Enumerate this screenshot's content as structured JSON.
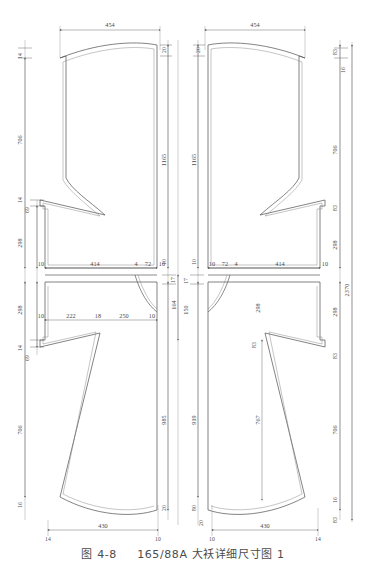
{
  "figure": {
    "caption_label": "图 4-8",
    "caption_title": "165/88A 大袄详细尺寸图 1",
    "caption_full": "图 4-8　165/88A 大袄详细尺寸图 1",
    "line_color": "#555555",
    "dim_color": "#4a4a4a",
    "background": "#ffffff"
  },
  "left_piece": {
    "name": "front-panel-left",
    "top_width": "454",
    "bottom_width": "430",
    "dims_top": [
      "20",
      "20"
    ],
    "dims_left_chain": [
      "14",
      "706",
      "14",
      "69",
      "298",
      "298",
      "14",
      "69",
      "706",
      "16"
    ],
    "dims_right_chain": [
      "1165",
      "10",
      "17",
      "164",
      "985",
      "20"
    ],
    "dims_waist_row": [
      "10",
      "414",
      "4",
      "72",
      "10"
    ],
    "dims_hip_row": [
      "10",
      "222",
      "18",
      "250",
      "10"
    ],
    "dims_bottom_row": [
      "14",
      "430",
      "10"
    ]
  },
  "right_piece": {
    "name": "front-panel-right",
    "top_width": "454",
    "bottom_width": "430",
    "dims_top": [
      "20",
      "20"
    ],
    "dims_left_chain": [
      "1165",
      "10",
      "17",
      "150",
      "298",
      "919",
      "80",
      "20"
    ],
    "dims_right_chain": [
      "83",
      "16",
      "706",
      "83",
      "298",
      "298",
      "83",
      "16",
      "706",
      "83"
    ],
    "dims_waist_row": [
      "10",
      "72",
      "4",
      "414",
      "10"
    ],
    "dims_hip_row": [
      "298",
      "767"
    ],
    "dims_bottom_row": [
      "10",
      "430",
      "14"
    ],
    "overall_height": "2370"
  },
  "dimensions": {
    "d454": "454",
    "d430": "430",
    "d2370": "2370",
    "d1165": "1165",
    "d985": "985",
    "d919": "919",
    "d767": "767",
    "d706": "706",
    "d414": "414",
    "d298": "298",
    "d250": "250",
    "d222": "222",
    "d164": "164",
    "d150": "150",
    "d83": "83",
    "d80": "80",
    "d72": "72",
    "d69": "69",
    "d20": "20",
    "d18": "18",
    "d17": "17",
    "d16": "16",
    "d14": "14",
    "d10": "10",
    "d4": "4"
  }
}
